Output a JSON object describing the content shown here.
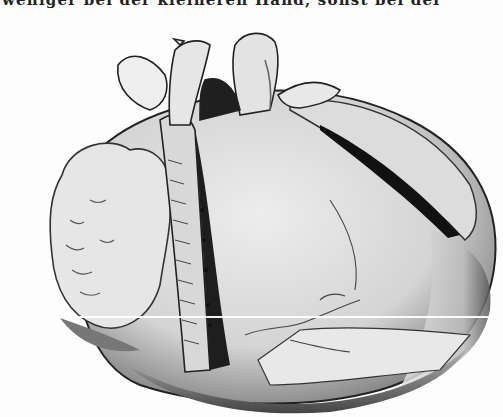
{
  "page": {
    "top_text_fragment": "weniger bei der kleineren Hand, sonst bei der",
    "figure": {
      "subject": "anatomical engraving of a heart with opened ventricles and great vessels",
      "caption": ""
    }
  },
  "colors": {
    "paper": "#fdfdfd",
    "ink": "#1a1a1a",
    "mid_shade": "#8a8a8a",
    "light_shade": "#d8d8d8"
  }
}
